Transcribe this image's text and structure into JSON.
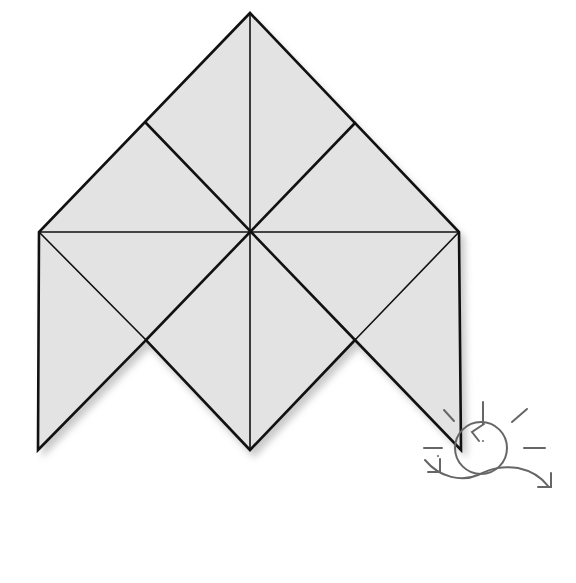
{
  "diagram": {
    "type": "geometric-tiling",
    "colors": {
      "fill": "#e3e3e3",
      "stroke": "#111111",
      "shadow": "#bdbdbd",
      "icon": "#666666",
      "background": "#ffffff"
    },
    "outline_vertices": [
      [
        250,
        13
      ],
      [
        459,
        232
      ],
      [
        461,
        450
      ],
      [
        355,
        340
      ],
      [
        250,
        450
      ],
      [
        146,
        340
      ],
      [
        38,
        450
      ],
      [
        39,
        232
      ]
    ],
    "center": [
      250,
      232
    ],
    "inner_points": {
      "upper_left": [
        146,
        123
      ],
      "upper_right": [
        355,
        123
      ],
      "lower_left": [
        146,
        340
      ],
      "lower_right": [
        355,
        340
      ]
    },
    "thick_segments": [
      [
        [
          146,
          123
        ],
        [
          355,
          340
        ]
      ],
      [
        [
          355,
          123
        ],
        [
          146,
          340
        ]
      ]
    ],
    "thin_segments": [
      [
        [
          250,
          13
        ],
        [
          250,
          450
        ]
      ],
      [
        [
          39,
          232
        ],
        [
          459,
          232
        ]
      ],
      [
        [
          39,
          232
        ],
        [
          146,
          340
        ]
      ],
      [
        [
          459,
          232
        ],
        [
          355,
          340
        ]
      ]
    ],
    "triangle_count": 16,
    "icon": {
      "name": "rotate-icon",
      "center": [
        485,
        453
      ],
      "radius": 26
    }
  }
}
